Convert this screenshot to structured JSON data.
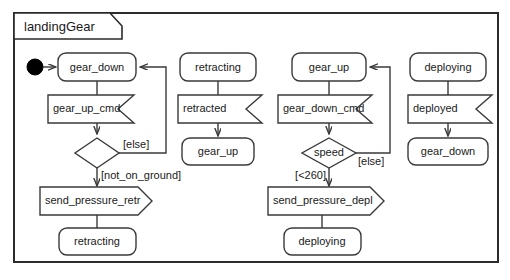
{
  "frame": {
    "title": "landingGear"
  },
  "branches": {
    "gear_down_branch": {
      "initial_state": "gear_down",
      "trigger": "gear_up_cmd",
      "decision": "",
      "guard_true": "[not_on_ground]",
      "guard_else": "[else]",
      "action": "send_pressure_retr",
      "target_state": "retracting"
    },
    "retracting_branch": {
      "initial_state": "retracting",
      "trigger": "retracted",
      "target_state": "gear_up"
    },
    "gear_up_branch": {
      "initial_state": "gear_up",
      "trigger": "gear_down_cmd",
      "decision": "speed",
      "guard_true": "[<260]",
      "guard_else": "[else]",
      "action": "send_pressure_depl",
      "target_state": "deploying"
    },
    "deploying_branch": {
      "initial_state": "deploying",
      "trigger": "deployed",
      "target_state": "gear_down"
    }
  },
  "icons": {
    "initial_node": "filled-circle"
  },
  "colors": {
    "stroke": "#3a3a3a",
    "frame_stroke": "#2b2b2b",
    "fill": "#ffffff",
    "text": "#1a1a1a"
  }
}
